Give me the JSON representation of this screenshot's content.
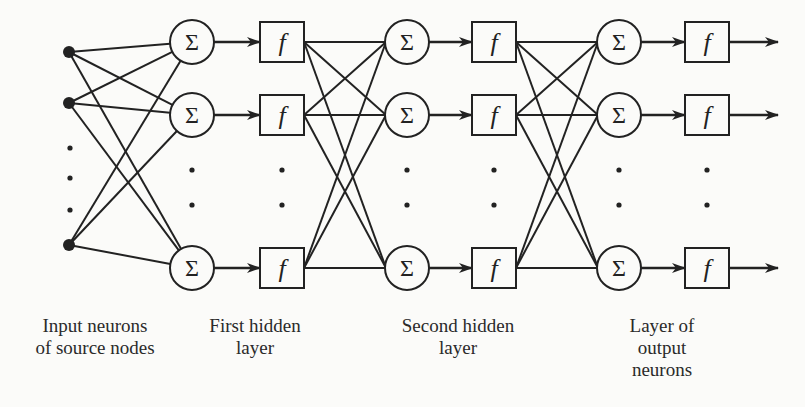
{
  "diagram": {
    "colors": {
      "stroke": "#222222",
      "background": "#fbfbf9",
      "text": "#2a2a2a"
    },
    "node_symbols": {
      "summation": "Σ",
      "activation": "f"
    },
    "rows_y": [
      42,
      115,
      268
    ],
    "input_rows_y": [
      52,
      103,
      245
    ],
    "input_x": 69,
    "input_ellipsis": {
      "x": 70,
      "y": [
        148,
        178,
        210
      ]
    },
    "layers": [
      {
        "id": "input",
        "type": "source",
        "label_lines": [
          "Input neurons",
          "of source nodes"
        ]
      },
      {
        "id": "hidden1",
        "type": "sum+activation",
        "sum_x": 192,
        "f_x": 282,
        "label_lines": [
          "First hidden",
          "layer"
        ]
      },
      {
        "id": "hidden2",
        "type": "sum+activation",
        "sum_x": 407,
        "f_x": 494,
        "label_lines": [
          "Second hidden",
          "layer"
        ]
      },
      {
        "id": "output",
        "type": "sum+activation",
        "sum_x": 619,
        "f_x": 707,
        "label_lines": [
          "Layer of",
          "output",
          "neurons"
        ]
      }
    ],
    "layer_ellipsis_y": [
      170,
      205
    ],
    "output_arrow_end_x": 778
  },
  "labels": {
    "input": {
      "line1": "Input neurons",
      "line2": "of source nodes"
    },
    "hidden1": {
      "line1": "First hidden",
      "line2": "layer"
    },
    "hidden2": {
      "line1": "Second hidden",
      "line2": "layer"
    },
    "output": {
      "line1": "Layer of",
      "line2": "output",
      "line3": "neurons"
    }
  },
  "symbols": {
    "sum": "Σ",
    "f": "f"
  }
}
